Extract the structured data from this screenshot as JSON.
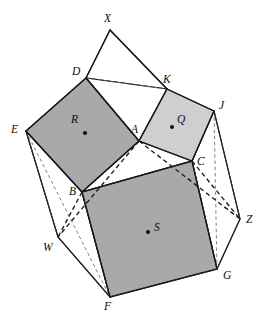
{
  "figure": {
    "background_color": "#ffffff",
    "line_color": "#1a1a1a",
    "width": 265,
    "height": 330
  },
  "palette": {
    "square_r_fill": "#a9a9a9",
    "square_s_fill": "#a9a9a9",
    "square_q_fill": "#cfcfcf",
    "white_face": "#ffffff",
    "stroke": "#1a1a1a",
    "dashed_light": "#6b6b6b"
  },
  "points": {
    "A": {
      "x": 139,
      "y": 141,
      "label": "A",
      "lx": 131,
      "ly": 126
    },
    "B": {
      "x": 82,
      "y": 192,
      "label": "B",
      "lx": 70,
      "ly": 192
    },
    "C": {
      "x": 192,
      "y": 161,
      "label": "C",
      "lx": 197,
      "ly": 158
    },
    "D": {
      "x": 86,
      "y": 78,
      "label": "D",
      "lx": 72,
      "ly": 66
    },
    "E": {
      "x": 26,
      "y": 131,
      "label": "E",
      "lx": 11,
      "ly": 126
    },
    "F": {
      "x": 110,
      "y": 297,
      "label": "F",
      "lx": 104,
      "ly": 304
    },
    "G": {
      "x": 217,
      "y": 269,
      "label": "G",
      "lx": 223,
      "ly": 272
    },
    "J": {
      "x": 214,
      "y": 111,
      "label": "J",
      "lx": 219,
      "ly": 100
    },
    "K": {
      "x": 167,
      "y": 89,
      "label": "K",
      "lx": 163,
      "ly": 74
    },
    "W": {
      "x": 58,
      "y": 237,
      "label": "W",
      "lx": 44,
      "ly": 243
    },
    "X": {
      "x": 110,
      "y": 30,
      "label": "X",
      "lx": 104,
      "ly": 13
    },
    "Z": {
      "x": 240,
      "y": 219,
      "label": "Z",
      "lx": 246,
      "ly": 216
    }
  },
  "square_centers": {
    "R": {
      "x": 85,
      "y": 133,
      "label": "R",
      "lx": 72,
      "ly": 120,
      "dot_x": 85,
      "dot_y": 133
    },
    "Q": {
      "x": 178,
      "y": 126,
      "label": "Q",
      "lx": 179,
      "ly": 118,
      "dot_x": 172,
      "dot_y": 127
    },
    "S": {
      "x": 152,
      "y": 231,
      "label": "S",
      "lx": 155,
      "ly": 224,
      "dot_x": 148,
      "dot_y": 232
    }
  },
  "faces": [
    {
      "name": "square-R",
      "vertices": "D,E,B,A",
      "fill": "#a9a9a9",
      "shaded": true
    },
    {
      "name": "square-Q",
      "vertices": "K,A,C,J",
      "fill": "#cfcfcf",
      "shaded": true
    },
    {
      "name": "square-S",
      "vertices": "B,C,G,F",
      "fill": "#a9a9a9",
      "shaded": true
    },
    {
      "name": "triangle-ABC",
      "vertices": "A,B,C",
      "fill": "#ffffff",
      "shaded": false
    },
    {
      "name": "triangle-DXK",
      "vertices": "D,X,K",
      "fill": "#ffffff",
      "shaded": false
    },
    {
      "name": "quad-DAK",
      "vertices": "D,A,K",
      "fill": "#ffffff",
      "shaded": false
    },
    {
      "name": "prism-face-EBFW",
      "vertices": "E,B,F,W",
      "fill": "#ffffff",
      "shaded": false
    },
    {
      "name": "prism-face-CJZG",
      "vertices": "C,J,Z,G",
      "fill": "#ffffff",
      "shaded": false
    }
  ],
  "edges_solid": [
    "X-D",
    "X-K",
    "D-E",
    "E-B",
    "B-A",
    "A-D",
    "K-A",
    "A-C",
    "C-J",
    "J-K",
    "B-C",
    "C-G",
    "G-F",
    "F-B",
    "E-W",
    "W-F",
    "E-F",
    "J-Z",
    "Z-G",
    "J-G"
  ],
  "edges_dashed_bold": [
    "A-W",
    "A-Z",
    "B-W",
    "C-Z"
  ],
  "edges_dashed_light": [
    "D-K",
    "E-F",
    "J-G"
  ],
  "labels": [
    "X",
    "D",
    "K",
    "J",
    "E",
    "A",
    "C",
    "B",
    "Z",
    "W",
    "S",
    "F",
    "G",
    "R",
    "Q"
  ]
}
